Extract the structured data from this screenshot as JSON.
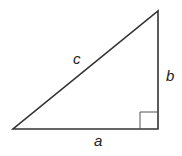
{
  "diagram": {
    "type": "right-triangle",
    "vertices": {
      "bottom_left": [
        13,
        129
      ],
      "bottom_right": [
        158,
        129
      ],
      "top": [
        158,
        11
      ]
    },
    "right_angle_marker": {
      "x": 140,
      "y": 112,
      "size": 17
    },
    "labels": {
      "hypotenuse": "c",
      "vertical_leg": "b",
      "horizontal_leg": "a"
    },
    "colors": {
      "stroke": "#333333",
      "marker": "#555555",
      "text": "#222222"
    }
  }
}
